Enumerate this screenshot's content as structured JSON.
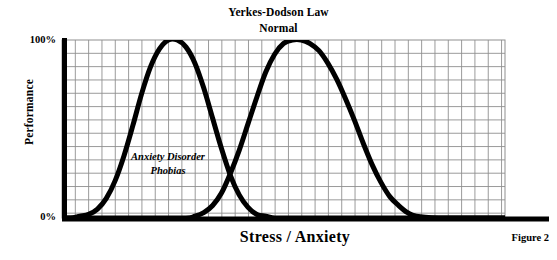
{
  "chart_data": {
    "type": "line",
    "title": "Yerkes-Dodson Law",
    "subtitle": "Normal",
    "xlabel": "Stress / Anxiety",
    "ylabel": "Performance",
    "caption": "Figure 2",
    "grid": true,
    "legend_position": "none",
    "ylim": [
      0,
      100
    ],
    "ytick_labels": [
      "0%",
      "100%"
    ],
    "xtick_labels": [],
    "annotations": [
      {
        "name": "anxiety-disorder-phobias",
        "lines": [
          "Anxiety Disorder",
          "Phobias"
        ],
        "line1": "Anxiety Disorder",
        "line2": "Phobias",
        "x": 0.29,
        "y": 0.38
      }
    ],
    "series": [
      {
        "name": "Anxiety Disorder Phobias",
        "color": "#000000",
        "peak_x": 0.275,
        "peak_y": 100,
        "x": [
          0.0,
          0.02,
          0.04,
          0.06,
          0.08,
          0.1,
          0.12,
          0.14,
          0.16,
          0.18,
          0.2,
          0.22,
          0.24,
          0.26,
          0.28,
          0.3,
          0.32,
          0.34,
          0.36,
          0.38,
          0.4,
          0.42,
          0.44,
          0.46,
          0.48,
          0.5,
          0.55,
          0.6,
          0.7,
          0.8,
          0.9,
          1.0
        ],
        "y": [
          0,
          0,
          1,
          2,
          5,
          11,
          21,
          35,
          52,
          70,
          85,
          95,
          100,
          100,
          96,
          87,
          73,
          56,
          39,
          24,
          13,
          6,
          2,
          1,
          0,
          0,
          0,
          0,
          0,
          0,
          0,
          0
        ]
      },
      {
        "name": "Normal",
        "color": "#000000",
        "peak_x": 0.537,
        "peak_y": 100,
        "x": [
          0.0,
          0.1,
          0.2,
          0.28,
          0.3,
          0.32,
          0.34,
          0.36,
          0.38,
          0.4,
          0.42,
          0.44,
          0.46,
          0.48,
          0.5,
          0.52,
          0.54,
          0.56,
          0.58,
          0.6,
          0.62,
          0.64,
          0.66,
          0.68,
          0.7,
          0.72,
          0.74,
          0.76,
          0.78,
          0.8,
          0.85,
          0.9,
          1.0
        ],
        "y": [
          0,
          0,
          0,
          0,
          1,
          3,
          7,
          14,
          25,
          38,
          53,
          68,
          82,
          92,
          98,
          100,
          100,
          98,
          94,
          87,
          78,
          67,
          55,
          42,
          30,
          20,
          12,
          7,
          3,
          1,
          0,
          0,
          0
        ]
      }
    ],
    "intersection": {
      "x": 0.4,
      "y": 53
    }
  },
  "style": {
    "grid_color": "#8f8f8f",
    "axis_color": "#000000",
    "curve_color": "#000000",
    "background": "#ffffff"
  }
}
